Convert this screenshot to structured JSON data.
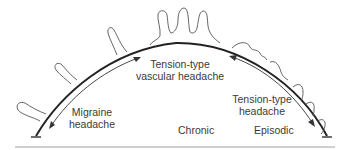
{
  "diagram": {
    "labels": {
      "tension_vascular_line1": "Tension-type",
      "tension_vascular_line2": "vascular headache",
      "migraine_line1": "Migraine",
      "migraine_line2": "headache",
      "tension_line1": "Tension-type",
      "tension_line2": "headache",
      "chronic": "Chronic",
      "episodic": "Episodic"
    },
    "colors": {
      "stroke": "#2a2a2a",
      "outline": "#555555",
      "baseline": "#9a9a9a",
      "text": "#3a3a3a"
    }
  }
}
